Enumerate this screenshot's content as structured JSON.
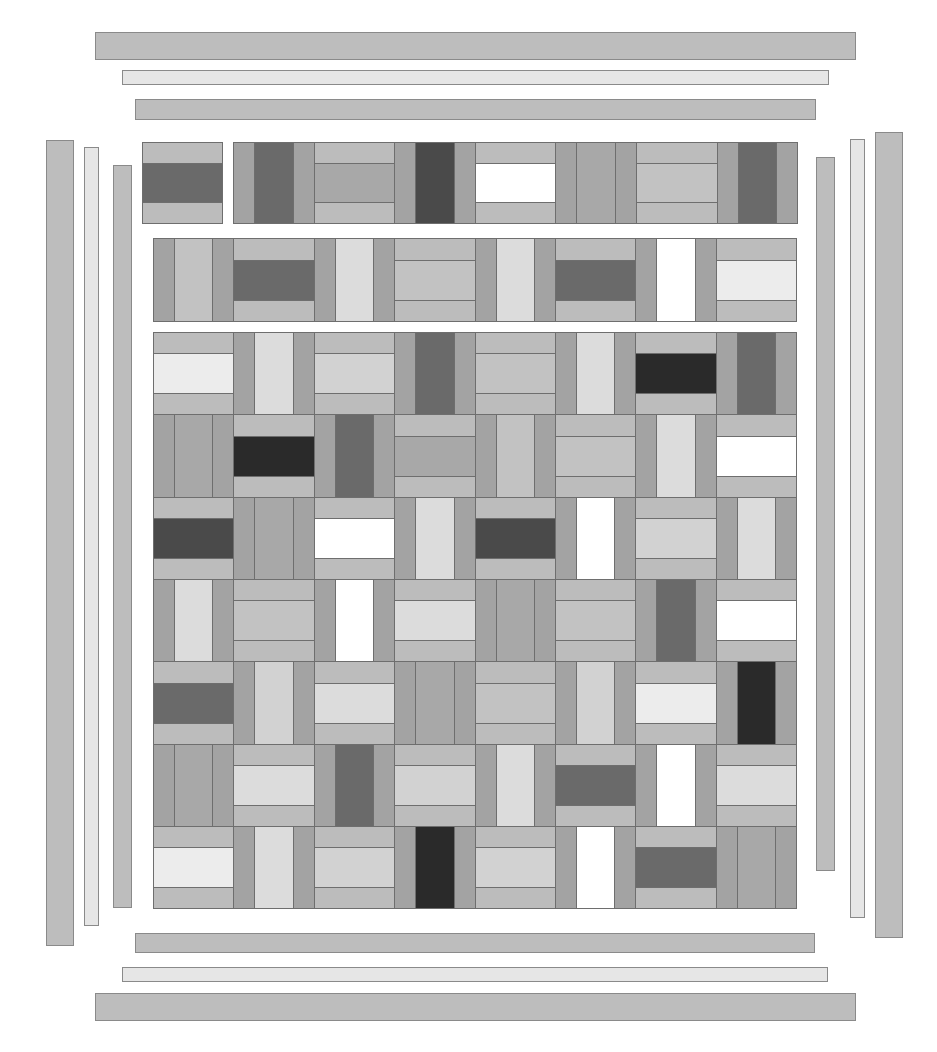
{
  "palette": {
    "border_mid": "#bdbdbd",
    "border_light": "#e6e6e6",
    "rail_outer": "#a3a3a3",
    "rail_side_light": "#bcbcbc",
    "white": "#ffffff",
    "lighter": "#ececec",
    "light": "#dcdcdc",
    "light_striped": "#d2d2d2",
    "mid_light": "#c2c2c2",
    "mid": "#a8a8a8",
    "dark": "#6a6a6a",
    "very_dark": "#4a4a4a",
    "black": "#2a2a2a"
  },
  "borders": {
    "top": [
      {
        "x": 95,
        "y": 32,
        "w": 761,
        "h": 28,
        "tone": "border_mid"
      },
      {
        "x": 122,
        "y": 70,
        "w": 707,
        "h": 15,
        "tone": "border_light"
      },
      {
        "x": 135,
        "y": 99,
        "w": 681,
        "h": 21,
        "tone": "border_mid"
      }
    ],
    "bottom": [
      {
        "x": 135,
        "y": 933,
        "w": 680,
        "h": 20,
        "tone": "border_mid"
      },
      {
        "x": 122,
        "y": 967,
        "w": 706,
        "h": 15,
        "tone": "border_light"
      },
      {
        "x": 95,
        "y": 993,
        "w": 761,
        "h": 28,
        "tone": "border_mid"
      }
    ],
    "left": [
      {
        "x": 46,
        "y": 140,
        "w": 28,
        "h": 806,
        "tone": "border_mid"
      },
      {
        "x": 84,
        "y": 147,
        "w": 15,
        "h": 779,
        "tone": "border_light"
      },
      {
        "x": 113,
        "y": 165,
        "w": 19,
        "h": 743,
        "tone": "border_mid"
      }
    ],
    "right": [
      {
        "x": 816,
        "y": 157,
        "w": 19,
        "h": 714,
        "tone": "border_mid"
      },
      {
        "x": 850,
        "y": 139,
        "w": 15,
        "h": 779,
        "tone": "border_light"
      },
      {
        "x": 875,
        "y": 132,
        "w": 28,
        "h": 806,
        "tone": "border_mid"
      }
    ]
  },
  "detached_block": {
    "x": 142,
    "y": 142,
    "w": 81,
    "h": 82,
    "orient": "H",
    "center": "dark"
  },
  "rows": [
    {
      "x": 233,
      "y": 142,
      "h": 82,
      "col_w": 80.6,
      "blocks": [
        {
          "orient": "V",
          "center": "dark"
        },
        {
          "orient": "H",
          "center": "mid"
        },
        {
          "orient": "V",
          "center": "very_dark"
        },
        {
          "orient": "H",
          "center": "white"
        },
        {
          "orient": "V",
          "center": "mid"
        },
        {
          "orient": "H",
          "center": "mid_light"
        },
        {
          "orient": "V",
          "center": "dark"
        }
      ]
    },
    {
      "x": 153,
      "y": 238,
      "h": 84,
      "col_w": 80.4,
      "blocks": [
        {
          "orient": "V",
          "center": "mid_light"
        },
        {
          "orient": "H",
          "center": "dark"
        },
        {
          "orient": "V",
          "center": "light"
        },
        {
          "orient": "H",
          "center": "mid_light"
        },
        {
          "orient": "V",
          "center": "light"
        },
        {
          "orient": "H",
          "center": "dark"
        },
        {
          "orient": "V",
          "center": "white"
        },
        {
          "orient": "H",
          "center": "lighter"
        }
      ]
    }
  ],
  "grid": {
    "x": 153,
    "y": 332,
    "col_w": 80.4,
    "row_h": 82.3,
    "rows": [
      [
        {
          "o": "H",
          "c": "lighter"
        },
        {
          "o": "V",
          "c": "light"
        },
        {
          "o": "H",
          "c": "light_striped"
        },
        {
          "o": "V",
          "c": "dark"
        },
        {
          "o": "H",
          "c": "mid_light"
        },
        {
          "o": "V",
          "c": "light"
        },
        {
          "o": "H",
          "c": "black"
        },
        {
          "o": "V",
          "c": "dark"
        }
      ],
      [
        {
          "o": "V",
          "c": "mid"
        },
        {
          "o": "H",
          "c": "black"
        },
        {
          "o": "V",
          "c": "dark"
        },
        {
          "o": "H",
          "c": "mid"
        },
        {
          "o": "V",
          "c": "mid_light"
        },
        {
          "o": "H",
          "c": "mid_light"
        },
        {
          "o": "V",
          "c": "light"
        },
        {
          "o": "H",
          "c": "white"
        }
      ],
      [
        {
          "o": "H",
          "c": "very_dark"
        },
        {
          "o": "V",
          "c": "mid"
        },
        {
          "o": "H",
          "c": "white"
        },
        {
          "o": "V",
          "c": "light"
        },
        {
          "o": "H",
          "c": "very_dark"
        },
        {
          "o": "V",
          "c": "white"
        },
        {
          "o": "H",
          "c": "light_striped"
        },
        {
          "o": "V",
          "c": "light"
        }
      ],
      [
        {
          "o": "V",
          "c": "light"
        },
        {
          "o": "H",
          "c": "mid_light"
        },
        {
          "o": "V",
          "c": "white"
        },
        {
          "o": "H",
          "c": "light"
        },
        {
          "o": "V",
          "c": "mid"
        },
        {
          "o": "H",
          "c": "mid_light"
        },
        {
          "o": "V",
          "c": "dark"
        },
        {
          "o": "H",
          "c": "white"
        }
      ],
      [
        {
          "o": "H",
          "c": "dark"
        },
        {
          "o": "V",
          "c": "light_striped"
        },
        {
          "o": "H",
          "c": "light"
        },
        {
          "o": "V",
          "c": "mid"
        },
        {
          "o": "H",
          "c": "mid_light"
        },
        {
          "o": "V",
          "c": "light_striped"
        },
        {
          "o": "H",
          "c": "lighter"
        },
        {
          "o": "V",
          "c": "black"
        }
      ],
      [
        {
          "o": "V",
          "c": "mid"
        },
        {
          "o": "H",
          "c": "light"
        },
        {
          "o": "V",
          "c": "dark"
        },
        {
          "o": "H",
          "c": "light_striped"
        },
        {
          "o": "V",
          "c": "light"
        },
        {
          "o": "H",
          "c": "dark"
        },
        {
          "o": "V",
          "c": "white"
        },
        {
          "o": "H",
          "c": "light"
        }
      ],
      [
        {
          "o": "H",
          "c": "lighter"
        },
        {
          "o": "V",
          "c": "light"
        },
        {
          "o": "H",
          "c": "light_striped"
        },
        {
          "o": "V",
          "c": "black"
        },
        {
          "o": "H",
          "c": "light_striped"
        },
        {
          "o": "V",
          "c": "white"
        },
        {
          "o": "H",
          "c": "dark"
        },
        {
          "o": "V",
          "c": "mid"
        }
      ]
    ]
  }
}
